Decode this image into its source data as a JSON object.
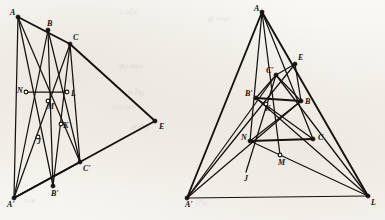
{
  "figure": {
    "background_color": "#f7f5f1",
    "ink_color": "#15120f",
    "width": 385,
    "height": 220,
    "panels": [
      {
        "id": "left-panel",
        "name": "left-configuration",
        "description": "Triangle ABC and triangle A'B'C' in perspective from point E, with axis line N-L",
        "points": [
          {
            "label": "A",
            "x": 18,
            "y": 17,
            "marker": "filled"
          },
          {
            "label": "B",
            "x": 48,
            "y": 30,
            "marker": "filled"
          },
          {
            "label": "C",
            "x": 70,
            "y": 44,
            "marker": "filled"
          },
          {
            "label": "E",
            "x": 155,
            "y": 121,
            "marker": "filled"
          },
          {
            "label": "N",
            "x": 26,
            "y": 92,
            "marker": "open"
          },
          {
            "label": "M",
            "x": 48,
            "y": 101,
            "marker": "open"
          },
          {
            "label": "L",
            "x": 67,
            "y": 92,
            "marker": "open"
          },
          {
            "label": "K",
            "x": 61,
            "y": 124,
            "marker": "open"
          },
          {
            "label": "J",
            "x": 38,
            "y": 137,
            "marker": "open"
          },
          {
            "label": "A'",
            "x": 14,
            "y": 198,
            "marker": "filled"
          },
          {
            "label": "B'",
            "x": 53,
            "y": 186,
            "marker": "filled"
          },
          {
            "label": "C'",
            "x": 80,
            "y": 162,
            "marker": "filled"
          }
        ],
        "label_offsets": [
          {
            "label": "A",
            "dx": -8,
            "dy": -2
          },
          {
            "label": "B",
            "dx": -1,
            "dy": -4
          },
          {
            "label": "C",
            "dx": 3,
            "dy": -4
          },
          {
            "label": "E",
            "dx": 4,
            "dy": 8
          },
          {
            "label": "N",
            "dx": -9,
            "dy": 1
          },
          {
            "label": "M",
            "dx": -1,
            "dy": 8
          },
          {
            "label": "L",
            "dx": 4,
            "dy": 4
          },
          {
            "label": "K",
            "dx": 2,
            "dy": 4
          },
          {
            "label": "J",
            "dx": -1,
            "dy": 7
          },
          {
            "label": "A'",
            "dx": -7,
            "dy": 9
          },
          {
            "label": "B'",
            "dx": -2,
            "dy": 10
          },
          {
            "label": "C'",
            "dx": 3,
            "dy": 9
          }
        ],
        "segments": [
          {
            "from": "A",
            "to": "C",
            "weight": "thick"
          },
          {
            "from": "C",
            "to": "E",
            "weight": "thick"
          },
          {
            "from": "E",
            "to": "A'",
            "weight": "thick"
          },
          {
            "from": "A'",
            "to": "C'",
            "weight": "thick"
          },
          {
            "from": "A",
            "to": "A'",
            "weight": "med"
          },
          {
            "from": "B",
            "to": "B'",
            "weight": "med"
          },
          {
            "from": "C",
            "to": "C'",
            "weight": "med"
          },
          {
            "from": "A",
            "to": "B'",
            "weight": "med"
          },
          {
            "from": "A",
            "to": "C'",
            "weight": "med"
          },
          {
            "from": "B",
            "to": "A'",
            "weight": "med"
          },
          {
            "from": "B",
            "to": "C'",
            "weight": "med"
          },
          {
            "from": "C",
            "to": "A'",
            "weight": "med"
          },
          {
            "from": "C",
            "to": "B'",
            "weight": "med"
          },
          {
            "from": "N",
            "to": "L",
            "weight": "med"
          }
        ]
      },
      {
        "id": "right-panel",
        "name": "right-configuration",
        "description": "Triangle ABC and triangle A'B'C' in perspective with points E, J, K, L, M, N",
        "points": [
          {
            "label": "A",
            "x": 262,
            "y": 12,
            "marker": "filled"
          },
          {
            "label": "E",
            "x": 295,
            "y": 64,
            "marker": "filled"
          },
          {
            "label": "C'",
            "x": 276,
            "y": 75,
            "marker": "filled"
          },
          {
            "label": "B'",
            "x": 256,
            "y": 98,
            "marker": "filled"
          },
          {
            "label": "K",
            "x": 266,
            "y": 104,
            "marker": "open"
          },
          {
            "label": "B",
            "x": 301,
            "y": 101,
            "marker": "filled"
          },
          {
            "label": "N",
            "x": 250,
            "y": 141,
            "marker": "filled"
          },
          {
            "label": "C",
            "x": 313,
            "y": 139,
            "marker": "filled"
          },
          {
            "label": "M",
            "x": 280,
            "y": 155,
            "marker": "open"
          },
          {
            "label": "J",
            "x": 246,
            "y": 172,
            "marker": "none"
          },
          {
            "label": "A'",
            "x": 187,
            "y": 198,
            "marker": "filled"
          },
          {
            "label": "L",
            "x": 368,
            "y": 196,
            "marker": "filled"
          }
        ],
        "label_offsets": [
          {
            "label": "A",
            "dx": -8,
            "dy": -1
          },
          {
            "label": "E",
            "dx": 3,
            "dy": -4
          },
          {
            "label": "C'",
            "dx": -10,
            "dy": -2
          },
          {
            "label": "B'",
            "dx": -11,
            "dy": -2
          },
          {
            "label": "K",
            "dx": -1,
            "dy": 7
          },
          {
            "label": "B",
            "dx": 4,
            "dy": 3
          },
          {
            "label": "N",
            "dx": -9,
            "dy": -1
          },
          {
            "label": "C",
            "dx": 5,
            "dy": 1
          },
          {
            "label": "M",
            "dx": -2,
            "dy": 10
          },
          {
            "label": "J",
            "dx": -2,
            "dy": 9
          },
          {
            "label": "A'",
            "dx": -2,
            "dy": 9
          },
          {
            "label": "L",
            "dx": 3,
            "dy": 9
          }
        ],
        "segments": [
          {
            "from": "A",
            "to": "A'",
            "weight": "thick"
          },
          {
            "from": "A",
            "to": "L",
            "weight": "thick"
          },
          {
            "from": "A'",
            "to": "L",
            "weight": "med"
          },
          {
            "from": "A",
            "to": "M",
            "weight": "med"
          },
          {
            "from": "A",
            "to": "C",
            "weight": "med"
          },
          {
            "from": "A",
            "to": "N",
            "weight": "med"
          },
          {
            "from": "A'",
            "to": "B",
            "weight": "med"
          },
          {
            "from": "A'",
            "to": "E",
            "weight": "med"
          },
          {
            "from": "A'",
            "to": "C'",
            "weight": "med"
          },
          {
            "from": "L",
            "to": "B'",
            "weight": "med"
          },
          {
            "from": "L",
            "to": "C'",
            "weight": "med"
          },
          {
            "from": "L",
            "to": "N",
            "weight": "med"
          },
          {
            "from": "B'",
            "to": "B",
            "weight": "thick"
          },
          {
            "from": "B'",
            "to": "C",
            "weight": "med"
          },
          {
            "from": "B",
            "to": "N",
            "weight": "med"
          },
          {
            "from": "N",
            "to": "C",
            "weight": "thick"
          },
          {
            "from": "C'",
            "to": "E",
            "weight": "med"
          },
          {
            "from": "C'",
            "to": "B",
            "weight": "med"
          },
          {
            "from": "C'",
            "to": "B'",
            "weight": "med"
          },
          {
            "from": "E",
            "to": "B",
            "weight": "med"
          },
          {
            "from": "J",
            "to": "C'",
            "weight": "med"
          }
        ]
      }
    ]
  },
  "bleed_text": [
    {
      "text": "अनुवाद",
      "x": 120,
      "y": 8,
      "size": 7,
      "rot": 180
    },
    {
      "text": "गणित की",
      "x": 208,
      "y": 14,
      "size": 7,
      "rot": 180
    },
    {
      "text": "सरल रेखा",
      "x": 118,
      "y": 62,
      "size": 7,
      "rot": 180
    },
    {
      "text": "त्रिभुज",
      "x": 60,
      "y": 76,
      "size": 7,
      "rot": 180
    },
    {
      "text": "बिंदु को",
      "x": 126,
      "y": 88,
      "size": 7,
      "rot": 180
    },
    {
      "text": "समानांतर",
      "x": 112,
      "y": 103,
      "size": 7,
      "rot": 180
    },
    {
      "text": "रेखाओं",
      "x": 132,
      "y": 122,
      "size": 7,
      "rot": 180
    },
    {
      "text": "कोण",
      "x": 24,
      "y": 196,
      "size": 7,
      "rot": 180
    },
    {
      "text": "सिद्ध",
      "x": 196,
      "y": 198,
      "size": 7,
      "rot": 180
    }
  ]
}
